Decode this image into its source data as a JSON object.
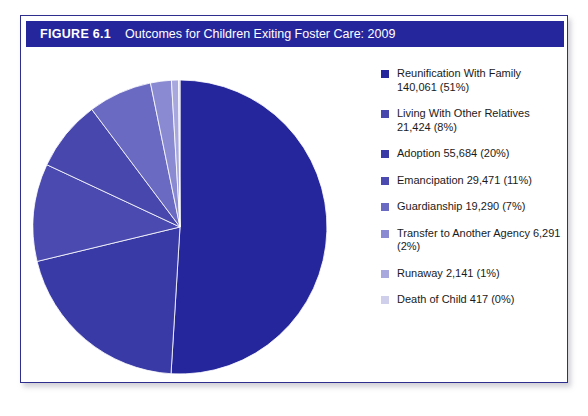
{
  "figure": {
    "number": "FIGURE 6.1",
    "title": "Outcomes for Children Exiting Foster Care: 2009",
    "header_bg": "#26269c",
    "border_color": "#2e2e8f"
  },
  "chart_data": {
    "type": "pie",
    "title": "Outcomes for Children Exiting Foster Care: 2009",
    "xlabel": "",
    "ylabel": "",
    "legend_position": "right",
    "grid": false,
    "start_angle_deg": 0,
    "direction": "clockwise",
    "categories": [
      "Reunification With Family",
      "Living With Other Relatives",
      "Adoption",
      "Emancipation",
      "Guardianship",
      "Transfer to Another Agency",
      "Runaway",
      "Death of Child"
    ],
    "values": [
      140061,
      21424,
      55684,
      29471,
      19290,
      6291,
      2141,
      417
    ],
    "percents": [
      51,
      8,
      20,
      11,
      7,
      2,
      1,
      0
    ],
    "colors": [
      "#26269c",
      "#4747ad",
      "#3a3aa6",
      "#4a4ab0",
      "#6a6ac2",
      "#8a8ad2",
      "#a8a8de",
      "#cfcfec"
    ],
    "slice_order_clockwise": [
      "Reunification With Family",
      "Adoption",
      "Emancipation",
      "Living With Other Relatives",
      "Guardianship",
      "Transfer to Another Agency",
      "Runaway",
      "Death of Child"
    ]
  },
  "legend": {
    "items": [
      {
        "label": "Reunification With Family 140,061 (51%)",
        "color": "#26269c"
      },
      {
        "label": "Living With Other Relatives 21,424 (8%)",
        "color": "#4747ad"
      },
      {
        "label": "Adoption 55,684 (20%)",
        "color": "#3a3aa6"
      },
      {
        "label": "Emancipation 29,471 (11%)",
        "color": "#4a4ab0"
      },
      {
        "label": "Guardianship 19,290 (7%)",
        "color": "#6a6ac2"
      },
      {
        "label": "Transfer to Another Agency 6,291 (2%)",
        "color": "#8a8ad2"
      },
      {
        "label": "Runaway 2,141 (1%)",
        "color": "#a8a8de"
      },
      {
        "label": "Death of Child 417 (0%)",
        "color": "#cfcfec"
      }
    ]
  }
}
